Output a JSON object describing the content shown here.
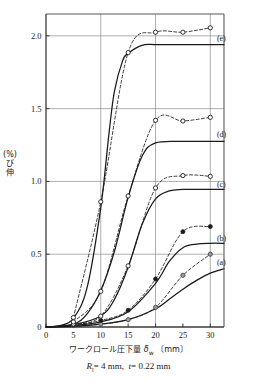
{
  "figure": {
    "caption_R_symbol": "R",
    "caption_R_sub": "l",
    "caption": "= 4 mm,",
    "caption_t_symbol": "t",
    "caption_t_value": "= 0.22 mm",
    "xlabel_text": "ワークロール圧下量",
    "xlabel_symbol": "δ",
    "xlabel_sub": "w",
    "xlabel_unit": "〔mm〕",
    "ylabel_chars": [
      "伸",
      "び",
      "(%)"
    ]
  },
  "chart_data": {
    "type": "line",
    "title": "",
    "xlabel": "ワークロール圧下量 δw 〔mm〕",
    "ylabel": "伸び (%)",
    "xlim": [
      0,
      32.5
    ],
    "ylim": [
      0,
      2.15
    ],
    "grid": true,
    "xticks": [
      0,
      5,
      10,
      15,
      20,
      25,
      30
    ],
    "xticklabels": [
      "0",
      "5",
      "10",
      "15",
      "20",
      "25",
      "30"
    ],
    "xgridlines": [
      10,
      20,
      30
    ],
    "yticks": [
      0,
      0.5,
      1.0,
      1.5,
      2.0
    ],
    "yticklabels": [
      "0",
      "0.5",
      "1.0",
      "1.5",
      "2.0"
    ],
    "ygridlines": [
      0.5,
      1.0,
      1.5,
      2.0
    ],
    "legend_position": "right-inline",
    "annotations": [
      {
        "label": "(e)",
        "x": 31.2,
        "y": 1.985
      },
      {
        "label": "(d)",
        "x": 31.2,
        "y": 1.33
      },
      {
        "label": "(c)",
        "x": 31.2,
        "y": 0.985
      },
      {
        "label": "(b)",
        "x": 31.2,
        "y": 0.615
      },
      {
        "label": "(a)",
        "x": 31.2,
        "y": 0.445
      }
    ],
    "series": [
      {
        "name": "(a) measured",
        "style": "dashed",
        "marker": "circle-half-gray",
        "x": [
          5,
          10,
          15,
          20,
          25,
          30
        ],
        "values": [
          0.01,
          0.02,
          0.05,
          0.135,
          0.355,
          0.5
        ]
      },
      {
        "name": "(a) calculated",
        "style": "solid",
        "marker": "none",
        "x": [
          0,
          5,
          10,
          15,
          20,
          22.5,
          25,
          27.5,
          30,
          32.5
        ],
        "values": [
          0.0,
          0.005,
          0.02,
          0.05,
          0.125,
          0.19,
          0.26,
          0.32,
          0.37,
          0.4
        ]
      },
      {
        "name": "(b) measured",
        "style": "dashed",
        "marker": "circle-filled",
        "x": [
          5,
          10,
          15,
          20,
          25,
          30
        ],
        "values": [
          0.015,
          0.045,
          0.115,
          0.33,
          0.655,
          0.69
        ]
      },
      {
        "name": "(b) calculated",
        "style": "solid",
        "marker": "none",
        "x": [
          0,
          5,
          10,
          15,
          20,
          22.5,
          25,
          27.5,
          30,
          32.5
        ],
        "values": [
          0.0,
          0.01,
          0.035,
          0.105,
          0.3,
          0.45,
          0.545,
          0.57,
          0.575,
          0.575
        ]
      },
      {
        "name": "(c) measured",
        "style": "dashed",
        "marker": "circle-open",
        "x": [
          5,
          10,
          15,
          20,
          25,
          30
        ],
        "values": [
          0.02,
          0.075,
          0.42,
          0.955,
          1.04,
          1.035
        ]
      },
      {
        "name": "(c) calculated",
        "style": "solid",
        "marker": "none",
        "x": [
          0,
          5,
          10,
          12.5,
          15,
          17.5,
          20,
          22.5,
          25,
          30,
          32.5
        ],
        "values": [
          0.0,
          0.015,
          0.075,
          0.19,
          0.41,
          0.7,
          0.88,
          0.935,
          0.945,
          0.945,
          0.945
        ]
      },
      {
        "name": "(d) measured",
        "style": "dashed",
        "marker": "circle-open",
        "x": [
          5,
          10,
          15,
          20,
          25,
          30
        ],
        "values": [
          0.035,
          0.245,
          0.9,
          1.42,
          1.415,
          1.44
        ]
      },
      {
        "name": "(d) calculated",
        "style": "solid",
        "marker": "none",
        "x": [
          0,
          5,
          7.5,
          10,
          12.5,
          15,
          17.5,
          20,
          25,
          30,
          32.5
        ],
        "values": [
          0.0,
          0.02,
          0.09,
          0.25,
          0.52,
          0.89,
          1.17,
          1.265,
          1.275,
          1.275,
          1.275
        ]
      },
      {
        "name": "(e) measured",
        "style": "dashed",
        "marker": "circle-open",
        "x": [
          5,
          10,
          15,
          20,
          25,
          30
        ],
        "values": [
          0.065,
          0.86,
          1.885,
          2.025,
          2.025,
          2.055
        ]
      },
      {
        "name": "(e) calculated",
        "style": "solid",
        "marker": "none",
        "x": [
          0,
          2.5,
          5,
          7.5,
          10,
          11.5,
          12.5,
          14,
          15,
          17.5,
          20,
          25,
          30,
          32.5
        ],
        "values": [
          0.0,
          0.01,
          0.06,
          0.27,
          0.82,
          1.33,
          1.62,
          1.83,
          1.88,
          1.935,
          1.94,
          1.94,
          1.94,
          1.94
        ]
      }
    ]
  }
}
